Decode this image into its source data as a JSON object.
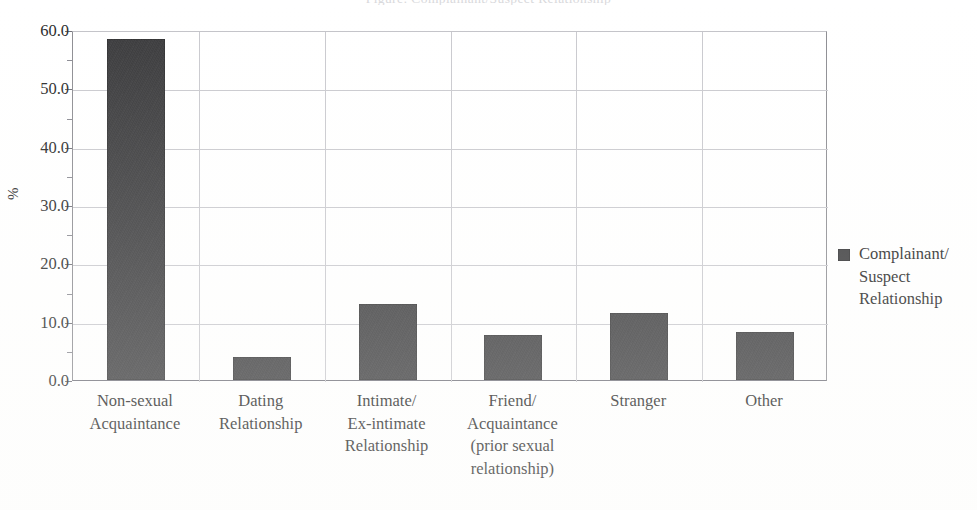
{
  "page": {
    "clipped_title_remnant": "Figure: Complainant/Suspect Relationship",
    "background_color": "#ffffff"
  },
  "chart_data": {
    "type": "bar",
    "title": "",
    "xlabel": "",
    "ylabel": "%",
    "ylim": [
      0,
      60
    ],
    "ytick_step": 10,
    "yminor_step": 5,
    "grid": true,
    "legend_position": "right",
    "bar_color": "#3a3a3c",
    "gridline_color": "#c9c9ce",
    "axis_color": "#70707a",
    "categories": [
      "Non-sexual Acquaintance",
      "Dating Relationship",
      "Intimate/ Ex-intimate Relationship",
      "Friend/ Acquaintance (prior sexual relationship)",
      "Stranger",
      "Other"
    ],
    "category_lines": [
      [
        "Non-sexual",
        "Acquaintance"
      ],
      [
        "Dating",
        "Relationship"
      ],
      [
        "Intimate/",
        "Ex-intimate",
        "Relationship"
      ],
      [
        "Friend/",
        "Acquaintance",
        "(prior sexual",
        "relationship)"
      ],
      [
        "Stranger"
      ],
      [
        "Other"
      ]
    ],
    "values": [
      58.4,
      3.9,
      13.0,
      7.8,
      11.5,
      8.3
    ],
    "ytick_labels": [
      "60.0",
      "50.0",
      "40.0",
      "30.0",
      "20.0",
      "10.0",
      "0.0"
    ],
    "ytick_values": [
      60,
      50,
      40,
      30,
      20,
      10,
      0
    ],
    "series": [
      {
        "name": "Complainant/ Suspect Relationship",
        "values": [
          58.4,
          3.9,
          13.0,
          7.8,
          11.5,
          8.3
        ]
      }
    ],
    "legend": [
      {
        "label": "Complainant/ Suspect Relationship",
        "label_lines": [
          "Complainant/",
          "Suspect",
          "Relationship"
        ],
        "color": "#3a3a3c",
        "swatch": "filled-square"
      }
    ]
  }
}
